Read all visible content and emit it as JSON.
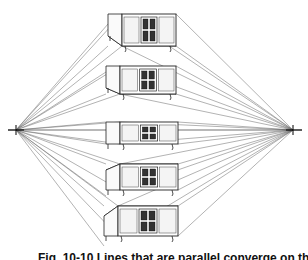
{
  "figure": {
    "type": "two-point perspective drawing",
    "vanishing_points": {
      "left": {
        "x": 16,
        "y": 130
      },
      "right": {
        "x": 293,
        "y": 130
      }
    },
    "horizon_y": 130,
    "line_color": "#555555",
    "cabinets": [
      {
        "label": "above horizon (high)",
        "x": 108,
        "y": 14,
        "w": 68,
        "h": 32,
        "top": 10,
        "view": "below"
      },
      {
        "label": "above horizon (mid)",
        "x": 106,
        "y": 66,
        "w": 70,
        "h": 28,
        "top": 6,
        "view": "below"
      },
      {
        "label": "on horizon",
        "x": 106,
        "y": 122,
        "w": 72,
        "h": 22,
        "top": 0,
        "view": "level"
      },
      {
        "label": "below horizon (mid)",
        "x": 106,
        "y": 164,
        "w": 72,
        "h": 26,
        "top": 6,
        "view": "above"
      },
      {
        "label": "below horizon (low)",
        "x": 104,
        "y": 206,
        "w": 74,
        "h": 30,
        "top": 10,
        "view": "above"
      }
    ]
  },
  "caption": {
    "text": "Fig. 10-10 Lines that are parallel converge on the horizon at the vanishing points."
  }
}
